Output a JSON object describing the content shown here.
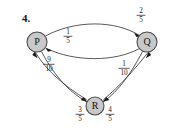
{
  "figure": {
    "question_number": "4.",
    "background_color": "#ffffff",
    "node_fill": "#c9c9c9",
    "node_stroke": "#4a4a4a",
    "edge_color": "#3a3a3a"
  },
  "nodes": [
    {
      "id": "P",
      "label": "P",
      "cx": 37,
      "cy": 42,
      "r": 10
    },
    {
      "id": "Q",
      "label": "Q",
      "cx": 147,
      "cy": 42,
      "r": 10
    },
    {
      "id": "R",
      "label": "R",
      "cx": 95,
      "cy": 106,
      "r": 9
    }
  ],
  "edges": [
    {
      "id": "p-to-q",
      "from": "P",
      "to": "Q",
      "label_numerator": "2",
      "label_denominator": "5",
      "label_x": 141,
      "label_y": 14
    },
    {
      "id": "q-to-p",
      "from": "Q",
      "to": "P",
      "label_numerator": "1",
      "label_denominator": "5",
      "label_x": 68,
      "label_y": 34
    },
    {
      "id": "p-to-r",
      "from": "P",
      "to": "R",
      "label_numerator": "3",
      "label_denominator": "5",
      "label_x": 80,
      "label_y": 113
    },
    {
      "id": "r-to-p",
      "from": "R",
      "to": "P",
      "label_numerator": "9",
      "label_denominator": "10",
      "label_x": 48,
      "label_y": 62
    },
    {
      "id": "q-to-r",
      "from": "Q",
      "to": "R",
      "label_numerator": "4",
      "label_denominator": "5",
      "label_x": 110,
      "label_y": 113
    },
    {
      "id": "r-to-q",
      "from": "R",
      "to": "Q",
      "label_numerator": "1",
      "label_denominator": "10",
      "label_x": 124,
      "label_y": 66
    }
  ]
}
